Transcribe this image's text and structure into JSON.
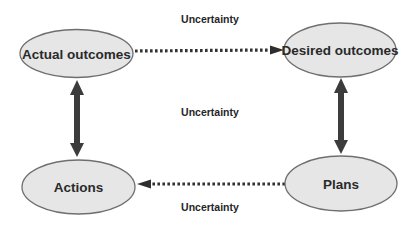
{
  "diagram": {
    "colors": {
      "background": "#ffffff",
      "node_fill": "#e6e6e6",
      "node_stroke": "#6f6f6f",
      "arrow": "#3c3c3c",
      "text": "#2a2a2a"
    },
    "nodes": {
      "actual_outcomes": {
        "label": "Actual outcomes"
      },
      "desired_outcomes": {
        "label": "Desired outcomes"
      },
      "actions": {
        "label": "Actions"
      },
      "plans": {
        "label": "Plans"
      }
    },
    "edges": {
      "top": {
        "from": "Actual outcomes",
        "to": "Desired outcomes",
        "style": "dotted",
        "label": "Uncertainty"
      },
      "middle": {
        "label": "Uncertainty"
      },
      "bottom": {
        "from": "Plans",
        "to": "Actions",
        "style": "dotted",
        "label": "Uncertainty"
      },
      "left": {
        "between": [
          "Actual outcomes",
          "Actions"
        ],
        "style": "bold-double-headed"
      },
      "right": {
        "between": [
          "Desired outcomes",
          "Plans"
        ],
        "style": "bold-double-headed"
      }
    }
  }
}
